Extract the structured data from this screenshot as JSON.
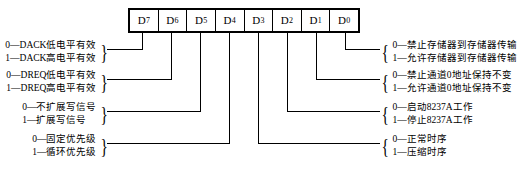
{
  "register": {
    "name": "8237A-command-register",
    "bits": [
      {
        "label": "D",
        "subscript": "7"
      },
      {
        "label": "D",
        "subscript": "6"
      },
      {
        "label": "D",
        "subscript": "5"
      },
      {
        "label": "D",
        "subscript": "4"
      },
      {
        "label": "D",
        "subscript": "3"
      },
      {
        "label": "D",
        "subscript": "2"
      },
      {
        "label": "D",
        "subscript": "1"
      },
      {
        "label": "D",
        "subscript": "0"
      }
    ]
  },
  "annotations_left": [
    {
      "bit": "D7",
      "name": "dack-polarity",
      "line0": "0—DACK低电平有效",
      "line1": "1—DACK高电平有效"
    },
    {
      "bit": "D6",
      "name": "dreq-polarity",
      "line0": "0—DREQ低电平有效",
      "line1": "1—DREQ高电平有效"
    },
    {
      "bit": "D5",
      "name": "extended-write",
      "line0": "0—不扩展写信号",
      "line1": "1—扩展写信号"
    },
    {
      "bit": "D4",
      "name": "priority-mode",
      "line0": "0—固定优先级",
      "line1": "1—循环优先级"
    }
  ],
  "annotations_right": [
    {
      "bit": "D0",
      "name": "memory-to-memory",
      "line0": "0—禁止存储器到存储器传输",
      "line1": "1—允许存储器到存储器传输"
    },
    {
      "bit": "D1",
      "name": "channel0-address-hold",
      "line0": "0—禁止通道0地址保持不变",
      "line1": "1—允许通道0地址保持不变"
    },
    {
      "bit": "D2",
      "name": "controller-enable",
      "line0": "0—启动8237A工作",
      "line1": "1—停止8237A工作"
    },
    {
      "bit": "D3",
      "name": "timing-mode",
      "line0": "0—正常时序",
      "line1": "1—压缩时序"
    }
  ],
  "braces": {
    "left": "}",
    "right": "{"
  }
}
